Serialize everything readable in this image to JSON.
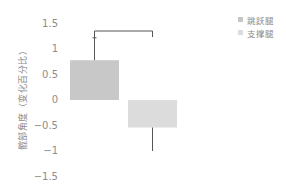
{
  "chart_data": {
    "type": "bar",
    "title": "",
    "xlabel": "",
    "ylabel": "髋部角度（变化百分比）",
    "categories": [
      "跳跃腿",
      "支撑腿"
    ],
    "values": [
      0.78,
      -0.54
    ],
    "error_bars": {
      "upper": [
        1.22,
        null
      ],
      "lower": [
        null,
        -1.0
      ]
    },
    "colors": [
      "#c8c8c8",
      "#dcdcdc"
    ],
    "ylim": [
      -1.5,
      1.5
    ],
    "yticks": [
      1.5,
      1,
      0.5,
      0,
      -0.5,
      -1,
      -1.5
    ],
    "ytick_labels": [
      "1.5",
      "1",
      "0.5",
      "0",
      "-0.5",
      "-1",
      "-1.5"
    ],
    "grid": false,
    "legend_position": "top-right",
    "legend": [
      {
        "label": "跳跃腿",
        "color": "#c6c6c6"
      },
      {
        "label": "支撑腿",
        "color": "#dcdcdc"
      }
    ],
    "annotations": [
      {
        "type": "significance-bracket",
        "between": [
          "跳跃腿",
          "支撑腿"
        ]
      }
    ]
  },
  "axis": {
    "ylabel": "髋部角度（变化百分比）",
    "ticks": [
      {
        "label": "1.5",
        "value": 1.5
      },
      {
        "label": "1",
        "value": 1
      },
      {
        "label": "0.5",
        "value": 0.5
      },
      {
        "label": "0",
        "value": 0
      },
      {
        "label": "-0.5",
        "value": -0.5
      },
      {
        "label": "-1",
        "value": -1
      },
      {
        "label": "-1.5",
        "value": -1.5
      }
    ]
  },
  "legend": {
    "items": [
      {
        "label": "跳跃腿",
        "color": "#c6c6c6"
      },
      {
        "label": "支撑腿",
        "color": "#dcdcdc"
      }
    ]
  }
}
